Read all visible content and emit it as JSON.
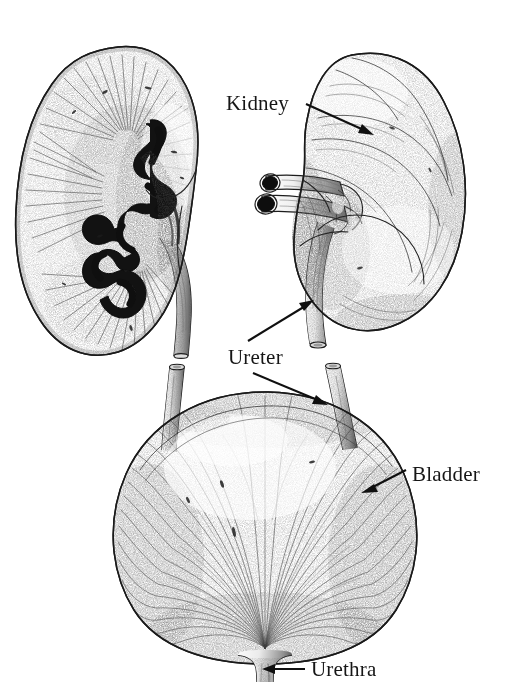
{
  "figure": {
    "style": "pen-and-ink stipple engraving",
    "background_color": "#ffffff",
    "ink_color": "#161616",
    "width": 530,
    "height": 682
  },
  "labels": [
    {
      "id": "kidney",
      "text": "Kidney",
      "x": 226,
      "y": 110,
      "leader": {
        "from": [
          306,
          104
        ],
        "to": [
          372,
          134
        ],
        "arrow": "end"
      }
    },
    {
      "id": "ureter",
      "text": "Ureter",
      "x": 228,
      "y": 364,
      "leaders": [
        {
          "from": [
            250,
            340
          ],
          "to": [
            313,
            301
          ],
          "arrow": "end"
        },
        {
          "from": [
            253,
            373
          ],
          "to": [
            326,
            404
          ],
          "arrow": "end"
        }
      ]
    },
    {
      "id": "bladder",
      "text": "Bladder",
      "x": 412,
      "y": 481,
      "leader": {
        "from": [
          406,
          470
        ],
        "to": [
          362,
          492
        ],
        "arrow": "end"
      }
    },
    {
      "id": "urethra",
      "text": "Urethra",
      "x": 311,
      "y": 676,
      "leader": {
        "from": [
          303,
          669
        ],
        "to": [
          263,
          669
        ],
        "arrow": "end"
      }
    }
  ],
  "organs": [
    {
      "id": "left-kidney-section",
      "name": "Kidney, coronal cross-section",
      "view": "sectioned",
      "features": [
        "renal cortex",
        "medullary pyramids",
        "renal pelvis",
        "major calyces",
        "ureter"
      ]
    },
    {
      "id": "right-kidney-whole",
      "name": "Kidney, external surface",
      "view": "whole",
      "features": [
        "renal hilum",
        "renal artery",
        "renal vein",
        "ureter"
      ]
    },
    {
      "id": "bladder",
      "name": "Urinary bladder",
      "view": "whole",
      "features": [
        "detrusor muscle fibres",
        "left ureteric stump",
        "right ureteric stump",
        "bladder neck",
        "urethra"
      ]
    }
  ]
}
